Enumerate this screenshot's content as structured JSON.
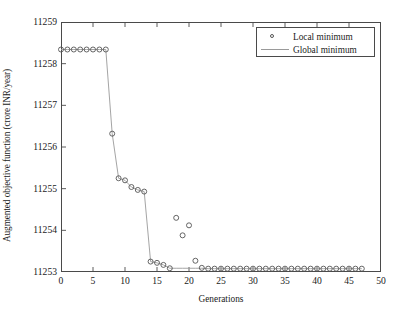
{
  "chart_data": {
    "type": "scatter",
    "title": "",
    "xlabel": "Generations",
    "ylabel": "Augmented objective function (crore INR/year)",
    "xlim": [
      0,
      50
    ],
    "ylim": [
      11253,
      11259
    ],
    "xticks": [
      0,
      5,
      10,
      15,
      20,
      25,
      30,
      35,
      40,
      45,
      50
    ],
    "yticks": [
      11253,
      11254,
      11255,
      11256,
      11257,
      11258,
      11259
    ],
    "grid": false,
    "legend_position": "top-right",
    "legend": [
      "Local minimum",
      "Global minimum"
    ],
    "series": [
      {
        "name": "Local minimum",
        "style": "markers",
        "marker": "circle-open",
        "color": "#555555",
        "x": [
          0,
          1,
          2,
          3,
          4,
          5,
          6,
          7,
          8,
          9,
          10,
          11,
          12,
          13,
          14,
          15,
          16,
          17,
          18,
          19,
          20,
          21,
          22,
          23,
          24,
          25,
          26,
          27,
          28,
          29,
          30,
          31,
          32,
          33,
          34,
          35,
          36,
          37,
          38,
          39,
          40,
          41,
          42,
          43,
          44,
          45,
          46,
          47
        ],
        "y": [
          11258.34,
          11258.34,
          11258.34,
          11258.34,
          11258.34,
          11258.34,
          11258.34,
          11258.34,
          11256.32,
          11255.25,
          11255.2,
          11255.04,
          11254.97,
          11254.93,
          11253.25,
          11253.22,
          11253.17,
          11253.09,
          11254.3,
          11253.88,
          11254.12,
          11253.27,
          11253.1,
          11253.08,
          11253.08,
          11253.08,
          11253.08,
          11253.08,
          11253.08,
          11253.08,
          11253.08,
          11253.08,
          11253.08,
          11253.08,
          11253.08,
          11253.08,
          11253.08,
          11253.08,
          11253.08,
          11253.08,
          11253.08,
          11253.08,
          11253.08,
          11253.08,
          11253.08,
          11253.08,
          11253.08,
          11253.08
        ]
      },
      {
        "name": "Global minimum",
        "style": "line",
        "color": "#9a9a9a",
        "x": [
          0,
          1,
          2,
          3,
          4,
          5,
          6,
          7,
          8,
          9,
          10,
          11,
          12,
          13,
          14,
          15,
          16,
          17,
          18,
          19,
          20,
          21,
          22,
          23,
          24,
          25,
          26,
          27,
          28,
          29,
          30,
          31,
          32,
          33,
          34,
          35,
          36,
          37,
          38,
          39,
          40,
          41,
          42,
          43,
          44,
          45,
          46,
          47
        ],
        "y": [
          11258.34,
          11258.34,
          11258.34,
          11258.34,
          11258.34,
          11258.34,
          11258.34,
          11258.34,
          11256.32,
          11255.25,
          11255.2,
          11255.04,
          11254.97,
          11254.93,
          11253.25,
          11253.22,
          11253.17,
          11253.09,
          11253.09,
          11253.09,
          11253.09,
          11253.09,
          11253.09,
          11253.08,
          11253.08,
          11253.08,
          11253.08,
          11253.08,
          11253.08,
          11253.08,
          11253.08,
          11253.08,
          11253.08,
          11253.08,
          11253.08,
          11253.08,
          11253.08,
          11253.08,
          11253.08,
          11253.08,
          11253.08,
          11253.08,
          11253.08,
          11253.08,
          11253.08,
          11253.08,
          11253.08,
          11253.08
        ]
      }
    ]
  },
  "legend": {
    "local_label": "Local minimum",
    "global_label": "Global minimum"
  },
  "axes": {
    "xlabel": "Generations",
    "ylabel": "Augmented objective function (crore INR/year)"
  }
}
